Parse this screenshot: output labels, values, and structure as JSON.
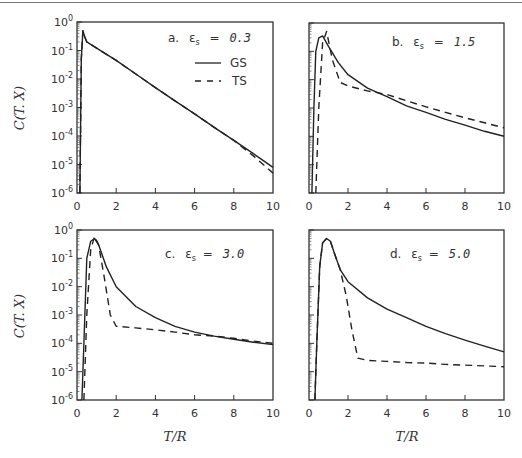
{
  "chart_data": [
    {
      "type": "line",
      "panel": "a",
      "title": "a. ε_s = 0.3",
      "annotation_prefix": "a.",
      "annotation_value": "0.3",
      "xlabel": "",
      "ylabel": "C(T. X)",
      "xlim": [
        0,
        10
      ],
      "ylim": [
        1e-06,
        1
      ],
      "yscale": "log",
      "xticks": [
        "0",
        "2",
        "4",
        "6",
        "8",
        "10"
      ],
      "yticks": [
        "10^0",
        "10^-1",
        "10^-2",
        "10^-3",
        "10^-4",
        "10^-5",
        "10^-6"
      ],
      "legend": [
        {
          "name": "GS",
          "style": "solid"
        },
        {
          "name": "TS",
          "style": "dashed"
        }
      ],
      "series": [
        {
          "name": "GS",
          "style": "solid",
          "x": [
            0.15,
            0.22,
            0.3,
            0.4,
            0.5,
            1,
            2,
            3,
            4,
            5,
            6,
            7,
            8,
            9,
            10
          ],
          "y": [
            1e-06,
            0.05,
            0.5,
            0.3,
            0.2,
            0.12,
            0.045,
            0.015,
            0.005,
            0.0017,
            0.0006,
            0.0002,
            7e-05,
            2.4e-05,
            8e-06
          ]
        },
        {
          "name": "TS",
          "style": "dashed",
          "x": [
            0.15,
            0.22,
            0.3,
            0.4,
            0.5,
            1,
            2,
            3,
            4,
            5,
            6,
            7,
            8,
            9,
            10
          ],
          "y": [
            1e-06,
            0.05,
            0.5,
            0.3,
            0.2,
            0.12,
            0.045,
            0.015,
            0.005,
            0.0017,
            0.0006,
            0.0002,
            7e-05,
            2e-05,
            5e-06
          ]
        }
      ]
    },
    {
      "type": "line",
      "panel": "b",
      "title": "b. ε_s = 1.5",
      "annotation_prefix": "b.",
      "annotation_value": "1.5",
      "xlabel": "",
      "ylabel": "",
      "xlim": [
        0,
        10
      ],
      "ylim": [
        1e-06,
        1
      ],
      "yscale": "log",
      "xticks": [
        "0",
        "2",
        "4",
        "6",
        "8",
        "10"
      ],
      "series": [
        {
          "name": "GS",
          "style": "solid",
          "x": [
            0.15,
            0.25,
            0.35,
            0.5,
            0.7,
            1,
            1.5,
            2,
            3,
            4,
            5,
            6,
            7,
            8,
            9,
            10
          ],
          "y": [
            1e-06,
            0.001,
            0.1,
            0.3,
            0.35,
            0.15,
            0.04,
            0.015,
            0.005,
            0.0025,
            0.0012,
            0.0007,
            0.0004,
            0.00025,
            0.00015,
            0.0001
          ]
        },
        {
          "name": "TS",
          "style": "dashed",
          "x": [
            0.35,
            0.5,
            0.7,
            0.9,
            1.2,
            1.6,
            2,
            3,
            4,
            5,
            6,
            7,
            8,
            9,
            10
          ],
          "y": [
            1e-06,
            0.001,
            0.2,
            0.5,
            0.05,
            0.008,
            0.006,
            0.004,
            0.003,
            0.0018,
            0.0011,
            0.0007,
            0.00045,
            0.0003,
            0.0002
          ]
        }
      ]
    },
    {
      "type": "line",
      "panel": "c",
      "title": "c. ε_s = 3.0",
      "annotation_prefix": "c.",
      "annotation_value": "3.0",
      "xlabel": "T/R",
      "ylabel": "C(T. X)",
      "xlim": [
        0,
        10
      ],
      "ylim": [
        1e-06,
        1
      ],
      "yscale": "log",
      "xticks": [
        "0",
        "2",
        "4",
        "6",
        "8",
        "10"
      ],
      "yticks": [
        "10^0",
        "10^-1",
        "10^-2",
        "10^-3",
        "10^-4",
        "10^-5",
        "10^-6"
      ],
      "series": [
        {
          "name": "GS",
          "style": "solid",
          "x": [
            0.25,
            0.35,
            0.5,
            0.7,
            0.9,
            1.1,
            1.5,
            2,
            3,
            4,
            5,
            6,
            7,
            8,
            9,
            10
          ],
          "y": [
            1e-06,
            0.0001,
            0.1,
            0.4,
            0.5,
            0.3,
            0.05,
            0.01,
            0.002,
            0.0008,
            0.0004,
            0.00025,
            0.00018,
            0.00014,
            0.00011,
            9e-05
          ]
        },
        {
          "name": "TS",
          "style": "dashed",
          "x": [
            0.35,
            0.5,
            0.7,
            0.9,
            1.1,
            1.4,
            1.7,
            2,
            3,
            4,
            5,
            6,
            7,
            8,
            9,
            10
          ],
          "y": [
            1e-06,
            0.001,
            0.2,
            0.6,
            0.3,
            0.02,
            0.001,
            0.0004,
            0.00035,
            0.0003,
            0.00025,
            0.0002,
            0.00018,
            0.00015,
            0.00012,
            0.0001
          ]
        }
      ]
    },
    {
      "type": "line",
      "panel": "d",
      "title": "d. ε_s = 5.0",
      "annotation_prefix": "d.",
      "annotation_value": "5.0",
      "xlabel": "T/R",
      "ylabel": "",
      "xlim": [
        0,
        10
      ],
      "ylim": [
        1e-06,
        1
      ],
      "yscale": "log",
      "xticks": [
        "0",
        "2",
        "4",
        "6",
        "8",
        "10"
      ],
      "series": [
        {
          "name": "GS",
          "style": "solid",
          "x": [
            0.3,
            0.4,
            0.55,
            0.7,
            0.9,
            1.1,
            1.3,
            1.6,
            2,
            3,
            4,
            5,
            6,
            7,
            8,
            9,
            10
          ],
          "y": [
            1e-06,
            0.0001,
            0.05,
            0.35,
            0.5,
            0.4,
            0.15,
            0.04,
            0.015,
            0.004,
            0.0016,
            0.0008,
            0.0004,
            0.00022,
            0.00013,
            8e-05,
            5e-05
          ]
        },
        {
          "name": "TS",
          "style": "dashed",
          "x": [
            0.3,
            0.4,
            0.55,
            0.7,
            0.9,
            1.1,
            1.3,
            1.6,
            1.9,
            2.2,
            2.5,
            3,
            4,
            5,
            6,
            7,
            8,
            9,
            10
          ],
          "y": [
            1e-06,
            0.0001,
            0.05,
            0.35,
            0.5,
            0.4,
            0.15,
            0.04,
            0.005,
            0.0003,
            3e-05,
            2.5e-05,
            2.3e-05,
            2.1e-05,
            2e-05,
            1.8e-05,
            1.7e-05,
            1.6e-05,
            1.5e-05
          ]
        }
      ]
    }
  ],
  "panels": {
    "a": {
      "label_prefix": "a.",
      "epsilon": "ε",
      "sub": "s",
      "eq": "=",
      "value": "0.3"
    },
    "b": {
      "label_prefix": "b.",
      "epsilon": "ε",
      "sub": "s",
      "eq": "=",
      "value": "1.5"
    },
    "c": {
      "label_prefix": "c.",
      "epsilon": "ε",
      "sub": "s",
      "eq": "=",
      "value": "3.0"
    },
    "d": {
      "label_prefix": "d.",
      "epsilon": "ε",
      "sub": "s",
      "eq": "=",
      "value": "5.0"
    }
  },
  "legend": {
    "gs": "GS",
    "ts": "TS"
  },
  "axes": {
    "ylabel": "C(T. X)",
    "xlabel": "T/R",
    "xticks": [
      "0",
      "2",
      "4",
      "6",
      "8",
      "10"
    ],
    "yticks_base": "10",
    "yticks_exp": [
      "0",
      "-1",
      "-2",
      "-3",
      "-4",
      "-5",
      "-6"
    ]
  },
  "colors": {
    "ink": "#222222",
    "frame": "#333333",
    "background": "#ffffff"
  }
}
